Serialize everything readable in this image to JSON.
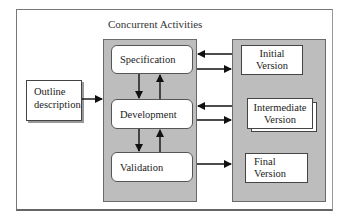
{
  "diagram": {
    "title": "Concurrent Activities",
    "input": {
      "label_line1": "Outline",
      "label_line2": "description"
    },
    "activities": [
      {
        "label": "Specification"
      },
      {
        "label": "Development"
      },
      {
        "label": "Validation"
      }
    ],
    "versions": [
      {
        "line1": "Initial",
        "line2": "Version"
      },
      {
        "line1": "Intermediate",
        "line2": "Version"
      },
      {
        "line1": "Final",
        "line2": "Version"
      }
    ],
    "colors": {
      "panel": "#bdbdbd",
      "box": "#ffffff",
      "stroke": "#222222"
    },
    "edges": [
      {
        "from": "Outline description",
        "to": "Concurrent Activities"
      },
      {
        "from": "Specification",
        "to": "Development"
      },
      {
        "from": "Development",
        "to": "Specification"
      },
      {
        "from": "Development",
        "to": "Validation"
      },
      {
        "from": "Validation",
        "to": "Development"
      },
      {
        "from": "Initial Version",
        "to": "Specification"
      },
      {
        "from": "Specification",
        "to": "Initial Version"
      },
      {
        "from": "Intermediate Version",
        "to": "Development"
      },
      {
        "from": "Development",
        "to": "Intermediate Version"
      },
      {
        "from": "Validation",
        "to": "Final Version"
      }
    ]
  }
}
